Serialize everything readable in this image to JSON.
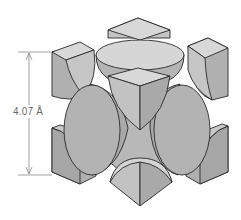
{
  "diagram": {
    "type": "face-centered cubic unit cell",
    "dimension_label": "4.07 Å",
    "colors": {
      "stroke": "#2a2a2a",
      "top_face": "#dadada",
      "light_side": "#c4c4c4",
      "dark_side": "#a8a8a8",
      "sphere": "#b3b3b3",
      "sphere_light": "#d4d4d4",
      "dimension_line": "#8a8a8a",
      "label": "#6a6a6a"
    }
  }
}
